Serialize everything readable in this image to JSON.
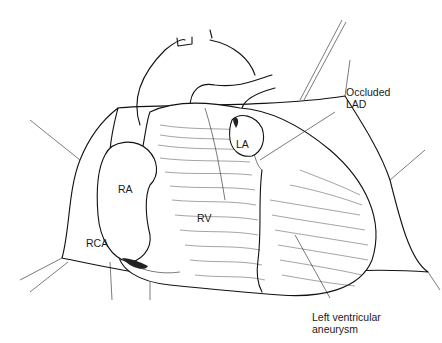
{
  "figure": {
    "labels": {
      "occluded_lad_line1": "Occluded",
      "occluded_lad_line2": "LAD",
      "la": "LA",
      "ra": "RA",
      "rv": "RV",
      "rca": "RCA",
      "lv_aneurysm_line1": "Left ventricular",
      "lv_aneurysm_line2": "aneurysm"
    }
  }
}
